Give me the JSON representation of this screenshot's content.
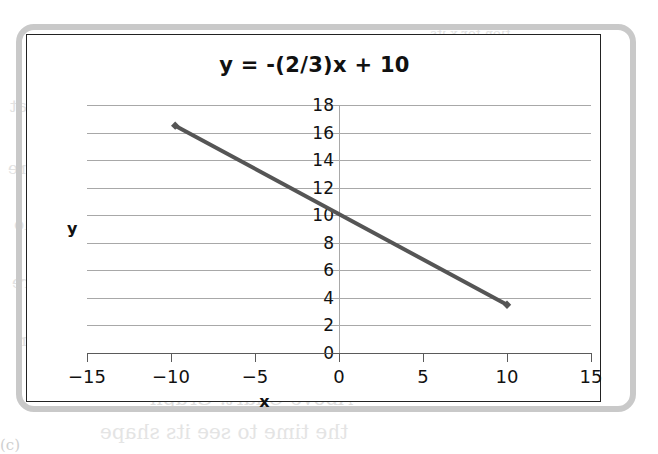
{
  "figure": {
    "frame_color": "#c9c9c9",
    "border_color": "#222222",
    "background": "#ffffff"
  },
  "bleed_text": {
    "line1": "tion for x its",
    "line2": "n sure that",
    "line3": "these are",
    "line4": "with a sure use ratio",
    "line5": "of have a line there",
    "line6": "in linear equation",
    "line7": "Above Chart: Graph",
    "line8": "the time to see its shape",
    "line9": "(c)"
  },
  "chart_data": {
    "type": "line",
    "title": "y = -(2/3)x + 10",
    "xlabel": "x",
    "ylabel": "y",
    "xlim": [
      -15,
      15
    ],
    "ylim": [
      0,
      18
    ],
    "xticks": [
      "−15",
      "−10",
      "−5",
      "0",
      "5",
      "10",
      "15"
    ],
    "xtick_values": [
      -15,
      -10,
      -5,
      0,
      5,
      10,
      15
    ],
    "yticks": [
      "0",
      "2",
      "4",
      "6",
      "8",
      "10",
      "12",
      "14",
      "16",
      "18"
    ],
    "ytick_values": [
      0,
      2,
      4,
      6,
      8,
      10,
      12,
      14,
      16,
      18
    ],
    "grid": "horizontal",
    "legend": "none",
    "series": [
      {
        "name": "y = -(2/3)x + 10",
        "color": "#555555",
        "line_width": 4,
        "marker": "diamond",
        "points": [
          {
            "x": -9.75,
            "y": 16.5
          },
          {
            "x": 10.0,
            "y": 3.5
          }
        ]
      }
    ],
    "equation": {
      "slope": "-2/3",
      "intercept": 10
    }
  }
}
